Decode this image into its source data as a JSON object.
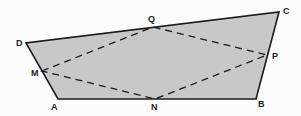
{
  "diagram": {
    "type": "quadrilateral-with-inscribed-midpoint-quadrilateral",
    "fill_color": "#c8c8c8",
    "stroke_color": "#1a1a1a",
    "vertices": {
      "A": {
        "label": "A",
        "x": 58,
        "y": 99
      },
      "B": {
        "label": "B",
        "x": 256,
        "y": 99
      },
      "C": {
        "label": "C",
        "x": 279,
        "y": 12
      },
      "D": {
        "label": "D",
        "x": 26,
        "y": 43
      }
    },
    "midpoints": {
      "M": {
        "label": "M",
        "x": 42,
        "y": 71
      },
      "N": {
        "label": "N",
        "x": 155,
        "y": 99
      },
      "P": {
        "label": "P",
        "x": 267,
        "y": 55
      },
      "Q": {
        "label": "Q",
        "x": 153,
        "y": 27
      }
    },
    "edges_solid": [
      "AB",
      "BC",
      "CD",
      "DA"
    ],
    "edges_dashed": [
      "MQ",
      "QP",
      "PN",
      "NM"
    ]
  }
}
